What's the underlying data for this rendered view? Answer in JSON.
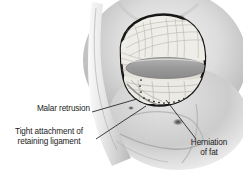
{
  "figure": {
    "type": "medical-illustration",
    "view": "oblique right hemiface, skin and orbicularis reflected",
    "palette": {
      "background": "#ffffff",
      "skin_light": "#e9e9e9",
      "skin_mid": "#c9c9c9",
      "skin_shadow": "#8f8f8f",
      "tissue_pale": "#f2f0ec",
      "tissue_mid": "#d8d5cf",
      "globe_gray": "#9d9d9d",
      "outline_dark": "#1c1c1c",
      "leader_line": "#2a2a2a",
      "text": "#1a1a1a"
    }
  },
  "labels": [
    {
      "id": "malar-retrusion",
      "text": "Malar retrusion",
      "lines": [
        "Malar retrusion"
      ],
      "align": "right",
      "x": 30,
      "y": 107,
      "leader": {
        "from": [
          92,
          112
        ],
        "to": [
          137,
          99
        ]
      },
      "marker": {
        "type": "dot",
        "x": 112,
        "y": 109
      }
    },
    {
      "id": "tight-attachment-retaining-ligament",
      "text": "Tight attachment of retaining ligament",
      "lines": [
        "Tight attachment of",
        "retaining ligament"
      ],
      "align": "center",
      "x": 8,
      "y": 130,
      "leader": {
        "from": [
          96,
          139
        ],
        "to": [
          146,
          106
        ]
      }
    },
    {
      "id": "herniation-of-fat",
      "text": "Herniation of fat",
      "lines": [
        "Herniation",
        "of fat"
      ],
      "align": "center",
      "x": 185,
      "y": 143,
      "leader": {
        "from": [
          196,
          139
        ],
        "to": [
          166,
          100
        ]
      }
    }
  ],
  "anatomy": {
    "structures": [
      {
        "name": "orbital-rim-opening",
        "label": "Dissected orbital window"
      },
      {
        "name": "globe-ellipse",
        "label": "Globe / lower lid margin"
      },
      {
        "name": "orbital-fat-pads",
        "label": "Herniated orbital fat"
      },
      {
        "name": "arcus-marginalis-dotted",
        "label": "Arcus marginalis (stippled)"
      },
      {
        "name": "orbicularis-retaining-ligament",
        "label": "Orbicularis retaining ligament"
      },
      {
        "name": "malar-eminence",
        "label": "Malar eminence (retruded)"
      },
      {
        "name": "nasojugal-groove",
        "label": "Nasojugal groove"
      },
      {
        "name": "nose-bridge",
        "label": "Nasal dorsum"
      },
      {
        "name": "brow-shadow-spot",
        "label": "Supraorbital shadow"
      },
      {
        "name": "cheek-shadow-spot",
        "label": "Midcheek shadow"
      }
    ]
  }
}
